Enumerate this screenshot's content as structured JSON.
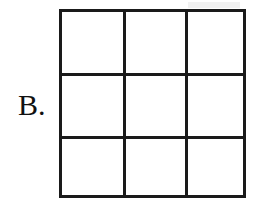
{
  "figure": {
    "label": "B.",
    "kind": "empty-3x3-grid",
    "background_color": "#ffffff",
    "line_color": "#1a1a1a",
    "line_width_px": 3,
    "grid": {
      "rows": 3,
      "columns": 3,
      "cell_count": 9,
      "left_px": 59,
      "top_px": 9,
      "width_px": 187,
      "height_px": 189,
      "vertical_line_x_px": [
        61,
        123
      ],
      "horizontal_line_y_px": [
        61,
        124
      ],
      "cells": [
        {
          "id": "r1c1",
          "row": 1,
          "column": 1,
          "content": ""
        },
        {
          "id": "r1c2",
          "row": 1,
          "column": 2,
          "content": ""
        },
        {
          "id": "r1c3",
          "row": 1,
          "column": 3,
          "content": ""
        },
        {
          "id": "r2c1",
          "row": 2,
          "column": 1,
          "content": ""
        },
        {
          "id": "r2c2",
          "row": 2,
          "column": 2,
          "content": ""
        },
        {
          "id": "r2c3",
          "row": 2,
          "column": 3,
          "content": ""
        },
        {
          "id": "r3c1",
          "row": 3,
          "column": 1,
          "content": ""
        },
        {
          "id": "r3c2",
          "row": 3,
          "column": 2,
          "content": ""
        },
        {
          "id": "r3c3",
          "row": 3,
          "column": 3,
          "content": ""
        }
      ]
    }
  }
}
